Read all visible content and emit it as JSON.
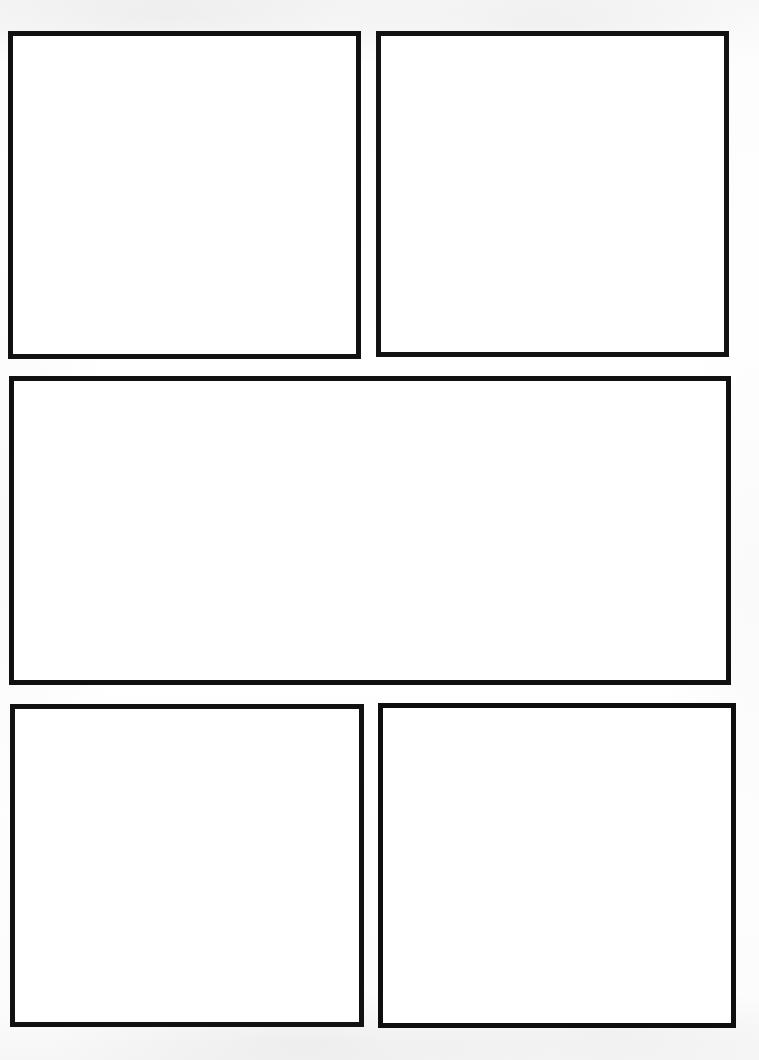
{
  "page": {
    "media": "scanned-paper",
    "width_px": 759,
    "height_px": 1060,
    "background_color": "#fcfcfc",
    "paper_color": "#ffffff",
    "border_color": "#121212",
    "border_width_px": 5,
    "panel_count": 5,
    "panel_fill": "",
    "layout_description": "Three-tier comic grid: two square panels on top, one wide panel across the middle, two square panels on the bottom."
  },
  "panels": [
    {
      "id": "panel-1",
      "label": "",
      "row": "top",
      "position": "left",
      "tier": 1,
      "x": 8,
      "y": 31,
      "width": 353,
      "height": 328,
      "border_color": "#121212",
      "content": ""
    },
    {
      "id": "panel-2",
      "label": "",
      "row": "top",
      "position": "right",
      "tier": 1,
      "x": 376,
      "y": 31,
      "width": 353,
      "height": 326,
      "border_color": "#131313",
      "content": ""
    },
    {
      "id": "panel-3",
      "label": "",
      "row": "middle",
      "position": "full-width",
      "tier": 2,
      "x": 9,
      "y": 376,
      "width": 722,
      "height": 309,
      "border_color": "#111111",
      "content": ""
    },
    {
      "id": "panel-4",
      "label": "",
      "row": "bottom",
      "position": "left",
      "tier": 3,
      "x": 10,
      "y": 704,
      "width": 354,
      "height": 323,
      "border_color": "#121212",
      "content": ""
    },
    {
      "id": "panel-5",
      "label": "",
      "row": "bottom",
      "position": "right",
      "tier": 3,
      "x": 378,
      "y": 703,
      "width": 358,
      "height": 325,
      "border_color": "#0f0f0f",
      "content": ""
    }
  ]
}
